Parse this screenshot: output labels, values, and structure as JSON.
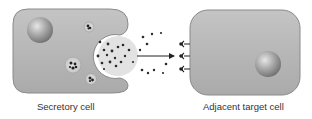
{
  "diagram": {
    "type": "paracrine-signaling",
    "labels": {
      "secretory_cell": "Secretory cell",
      "target_cell": "Adjacent target cell"
    },
    "colors": {
      "cell_fill": "#b8b8b8",
      "cell_edge": "#8a8a8a",
      "nucleus": "#9a9a9a",
      "molecule": "#2a2a2a",
      "arrow": "#222222",
      "background": "#ffffff"
    },
    "secretory_cell": {
      "vesicles": 3,
      "has_nucleus": true,
      "exocytosis_opening": "right"
    },
    "target_cell": {
      "receptors": 3,
      "has_nucleus": true
    },
    "arrow": {
      "direction": "right"
    }
  }
}
